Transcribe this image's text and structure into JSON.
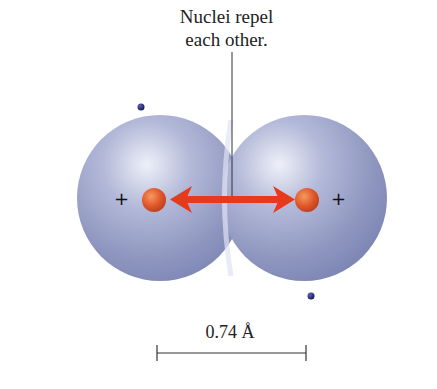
{
  "figure": {
    "title_line1": "Nuclei repel",
    "title_line2": "each other.",
    "left_atom": {
      "nucleus_charge": "+",
      "nucleus_color": "#e0552a"
    },
    "right_atom": {
      "nucleus_charge": "+",
      "nucleus_color": "#e0552a"
    },
    "arrow": {
      "type": "double-headed",
      "color": "#e63a1c",
      "meaning": "repulsion"
    },
    "electron_color": "#1e2266",
    "cloud_color": "#8f98c2",
    "scale_bar": {
      "label": "0.74 Å"
    }
  }
}
